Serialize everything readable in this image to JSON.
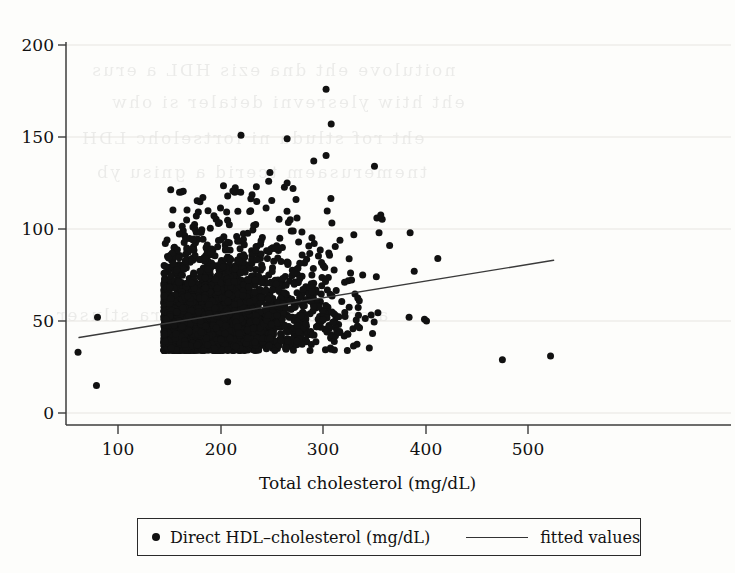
{
  "figure": {
    "background_color": "#fdfdfb",
    "ink_color": "#111111",
    "scan_artifact": "faint bleed-through ghost text from the reverse side of the scanned page, illegible"
  },
  "axes": {
    "x": {
      "label": "Total cholesterol (mg/dL)",
      "ticks": [
        100,
        200,
        300,
        400,
        500
      ],
      "tick_labels": [
        "100",
        "200",
        "300",
        "400",
        "500"
      ],
      "range": [
        48,
        535
      ],
      "gridlines": false
    },
    "y": {
      "label": "",
      "ticks": [
        0,
        50,
        100,
        150,
        200
      ],
      "tick_labels": [
        "0",
        "50",
        "100",
        "150",
        "200"
      ],
      "range": [
        -8,
        202
      ],
      "gridlines": true,
      "gridline_color": "#e3e1dd"
    }
  },
  "legend": {
    "position": "below-axis-title",
    "entries": [
      {
        "marker": "dot",
        "label": "Direct HDL–cholesterol (mg/dL)"
      },
      {
        "marker": "line",
        "label": "fitted values"
      }
    ]
  },
  "chart_data": {
    "type": "scatter",
    "title": "",
    "xlabel": "Total cholesterol (mg/dL)",
    "ylabel": "",
    "xlim": [
      48,
      535
    ],
    "ylim": [
      -8,
      202
    ],
    "grid": "horizontal-faint",
    "legend_position": "bottom",
    "series": [
      {
        "name": "Direct HDL–cholesterol (mg/dL)",
        "type": "scatter",
        "marker": "filled-circle",
        "marker_color": "#111111",
        "marker_size_px": 7,
        "n_points_approx": 2900,
        "description": "Dense elliptical cloud of individual observations; bulk spans total cholesterol 110-300 mg/dL with HDL 25-95 mg/dL, sparse tail extending to 525 mg/dL.",
        "cloud": {
          "x_core_range": [
            105,
            300
          ],
          "y_core_range": [
            25,
            95
          ],
          "x_full_range": [
            60,
            525
          ],
          "y_full_range": [
            14,
            176
          ],
          "x_mean": 200,
          "y_mean": 54,
          "x_sd": 42,
          "y_sd": 15,
          "correlation": 0.17
        },
        "notable_points": [
          {
            "x": 303,
            "y": 176
          },
          {
            "x": 308,
            "y": 157
          },
          {
            "x": 220,
            "y": 151
          },
          {
            "x": 265,
            "y": 149
          },
          {
            "x": 303,
            "y": 140
          },
          {
            "x": 291,
            "y": 137
          },
          {
            "x": 247,
            "y": 126
          },
          {
            "x": 265,
            "y": 125
          },
          {
            "x": 235,
            "y": 123
          },
          {
            "x": 207,
            "y": 118
          },
          {
            "x": 385,
            "y": 98
          },
          {
            "x": 412,
            "y": 84
          },
          {
            "x": 365,
            "y": 91
          },
          {
            "x": 389,
            "y": 77
          },
          {
            "x": 384,
            "y": 52
          },
          {
            "x": 399,
            "y": 51
          },
          {
            "x": 401,
            "y": 50
          },
          {
            "x": 475,
            "y": 29
          },
          {
            "x": 522,
            "y": 31
          },
          {
            "x": 61,
            "y": 33
          },
          {
            "x": 80,
            "y": 52
          },
          {
            "x": 79,
            "y": 15
          },
          {
            "x": 207,
            "y": 17
          }
        ]
      },
      {
        "name": "fitted values",
        "type": "line",
        "line_color": "#3a3a3a",
        "line_width_px": 1.4,
        "endpoints": [
          {
            "x": 62,
            "y": 41
          },
          {
            "x": 525,
            "y": 83
          }
        ],
        "slope_per_mg_dL": 0.0907,
        "intercept": 35.4
      }
    ]
  }
}
